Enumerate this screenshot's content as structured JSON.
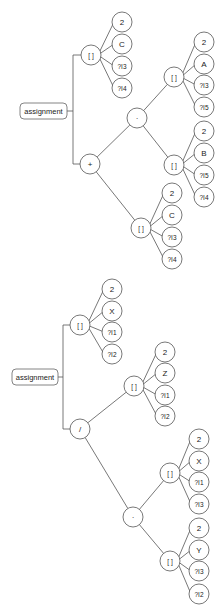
{
  "diagram": {
    "type": "expression-trees",
    "trees": [
      {
        "root": {
          "label": "assignment",
          "x": 20,
          "y": 103,
          "w": 47,
          "h": 16
        },
        "trunk_x": 73,
        "branches": [
          {
            "id": "t1-idx-lhs",
            "label": "[ ]",
            "x": 91,
            "y": 55,
            "children": [
              {
                "label": "2",
                "x": 122,
                "y": 22
              },
              {
                "label": "C",
                "x": 122,
                "y": 44
              },
              {
                "label": "?I3",
                "x": 122,
                "y": 66
              },
              {
                "label": "?I4",
                "x": 122,
                "y": 88
              }
            ]
          },
          {
            "id": "t1-plus",
            "label": "+",
            "x": 90,
            "y": 164
          }
        ],
        "inner": [
          {
            "id": "t1-mul",
            "label": "·",
            "x": 137,
            "y": 118,
            "parent": "t1-plus"
          },
          {
            "id": "t1-idx-a",
            "label": "[ ]",
            "x": 174,
            "y": 77,
            "parent": "t1-mul",
            "children": [
              {
                "label": "2",
                "x": 204,
                "y": 42
              },
              {
                "label": "A",
                "x": 204,
                "y": 64
              },
              {
                "label": "?I3",
                "x": 204,
                "y": 85
              },
              {
                "label": "?I5",
                "x": 204,
                "y": 107
              }
            ]
          },
          {
            "id": "t1-idx-b",
            "label": "[ ]",
            "x": 174,
            "y": 165,
            "parent": "t1-mul",
            "children": [
              {
                "label": "2",
                "x": 204,
                "y": 131
              },
              {
                "label": "B",
                "x": 204,
                "y": 153
              },
              {
                "label": "?I5",
                "x": 204,
                "y": 175
              },
              {
                "label": "?I4",
                "x": 204,
                "y": 197
              }
            ]
          },
          {
            "id": "t1-idx-c",
            "label": "[ ]",
            "x": 141,
            "y": 228,
            "parent": "t1-plus",
            "children": [
              {
                "label": "2",
                "x": 172,
                "y": 193
              },
              {
                "label": "C",
                "x": 172,
                "y": 215
              },
              {
                "label": "?I3",
                "x": 172,
                "y": 237
              },
              {
                "label": "?I4",
                "x": 172,
                "y": 259
              }
            ]
          }
        ]
      },
      {
        "root": {
          "label": "assignment",
          "x": 12,
          "y": 369,
          "w": 46,
          "h": 16
        },
        "trunk_x": 63,
        "branches": [
          {
            "id": "t2-idx-lhs",
            "label": "[ ]",
            "x": 80,
            "y": 325,
            "children": [
              {
                "label": "2",
                "x": 112,
                "y": 289
              },
              {
                "label": "X",
                "x": 112,
                "y": 311
              },
              {
                "label": "?I1",
                "x": 112,
                "y": 332
              },
              {
                "label": "?I2",
                "x": 112,
                "y": 354
              }
            ]
          },
          {
            "id": "t2-div",
            "label": "/",
            "x": 80,
            "y": 429
          }
        ],
        "inner": [
          {
            "id": "t2-idx-z",
            "label": "[ ]",
            "x": 134,
            "y": 386,
            "parent": "t2-div",
            "children": [
              {
                "label": "2",
                "x": 165,
                "y": 352
              },
              {
                "label": "Z",
                "x": 165,
                "y": 373
              },
              {
                "label": "?I1",
                "x": 165,
                "y": 395
              },
              {
                "label": "?I2",
                "x": 165,
                "y": 416
              }
            ]
          },
          {
            "id": "t2-mul",
            "label": "·",
            "x": 133,
            "y": 517,
            "parent": "t2-div"
          },
          {
            "id": "t2-idx-x",
            "label": "[ ]",
            "x": 170,
            "y": 473,
            "parent": "t2-mul",
            "children": [
              {
                "label": "2",
                "x": 199,
                "y": 439
              },
              {
                "label": "X",
                "x": 199,
                "y": 461
              },
              {
                "label": "?I1",
                "x": 199,
                "y": 482
              },
              {
                "label": "?I3",
                "x": 199,
                "y": 504
              }
            ]
          },
          {
            "id": "t2-idx-y",
            "label": "[ ]",
            "x": 170,
            "y": 561,
            "parent": "t2-mul",
            "children": [
              {
                "label": "2",
                "x": 199,
                "y": 528
              },
              {
                "label": "Y",
                "x": 199,
                "y": 550
              },
              {
                "label": "?I3",
                "x": 199,
                "y": 571
              },
              {
                "label": "?I2",
                "x": 199,
                "y": 594
              }
            ]
          }
        ]
      }
    ],
    "style": {
      "node_radius": 10,
      "stroke": "#555555",
      "background": "#ffffff"
    }
  }
}
